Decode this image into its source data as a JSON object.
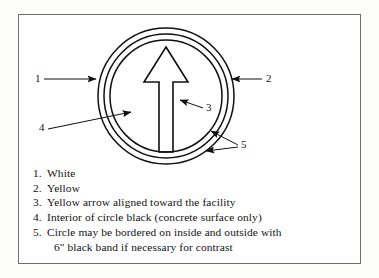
{
  "figure": {
    "frame_color": "#6e6e72",
    "line_color": "#101010",
    "background": "#ffffff"
  },
  "diagram": {
    "name": "circle-and-arrow-marking",
    "center": {
      "x": 166,
      "y": 96
    },
    "circles": [
      {
        "name": "outer-circle",
        "radius": 68,
        "callout": "1"
      },
      {
        "name": "middle-circle",
        "radius": 62,
        "callout": "2"
      },
      {
        "name": "inner-circle",
        "radius": 56,
        "callout": "5"
      }
    ],
    "arrow": {
      "name": "directional-arrow",
      "direction": "up",
      "tip": {
        "x": 166,
        "y": 47
      },
      "head_base_y": 82,
      "head_half_width": 22,
      "shaft_half_width": 7,
      "tail_y": 152,
      "callout": "3"
    }
  },
  "callouts": [
    {
      "id": "1",
      "label": "1",
      "x": 35,
      "y": 76,
      "target": "outer-circle"
    },
    {
      "id": "2",
      "label": "2",
      "x": 266,
      "y": 75,
      "target": "middle-circle"
    },
    {
      "id": "3",
      "label": "3",
      "x": 206,
      "y": 104,
      "target": "arrow-shaft"
    },
    {
      "id": "4",
      "label": "4",
      "x": 39,
      "y": 124,
      "target": "circle-interior"
    },
    {
      "id": "5",
      "label": "5",
      "x": 241,
      "y": 141,
      "target": "inner-and-outer-band"
    }
  ],
  "legend": {
    "items": [
      {
        "num": "1.",
        "text": "White"
      },
      {
        "num": "2.",
        "text": "Yellow"
      },
      {
        "num": "3.",
        "text": "Yellow arrow aligned toward the facility"
      },
      {
        "num": "4.",
        "text": "Interior of circle black (concrete surface only)"
      },
      {
        "num": "5.",
        "text": "Circle may be bordered on inside and outside with",
        "continuation": "6\" black band if necessary for contrast"
      }
    ]
  }
}
